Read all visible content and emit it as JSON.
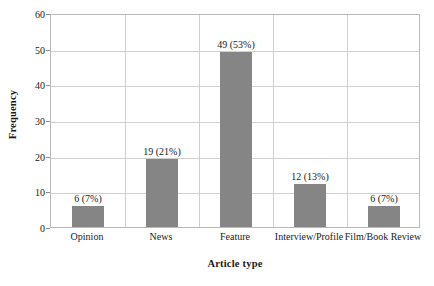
{
  "chart_data": {
    "type": "bar",
    "title": "",
    "xlabel": "Article type",
    "ylabel": "Frequency",
    "categories": [
      "Opinion",
      "News",
      "Feature",
      "Interview/Profile",
      "Film/Book Review"
    ],
    "values": [
      6,
      19,
      49,
      12,
      6
    ],
    "percentages": [
      "7%",
      "21%",
      "53%",
      "13%",
      "7%"
    ],
    "data_labels": [
      "6 (7%)",
      "19 (21%)",
      "49 (53%)",
      "12 (13%)",
      "6 (7%)"
    ],
    "ylim": [
      0,
      60
    ],
    "yticks": [
      0,
      10,
      20,
      30,
      40,
      50,
      60
    ],
    "ytick_labels": [
      "0",
      "10",
      "20",
      "30",
      "40",
      "50",
      "60"
    ],
    "grid": "horizontal-and-vertical",
    "legend": "none",
    "bar_color": "#858585",
    "gridline_color": "#cfcfcf",
    "axis_color": "#b9b9b9",
    "text_color": "#1a1a1a"
  },
  "axis_titles": {
    "x": "Article type",
    "y": "Frequency"
  },
  "y_ticks": [
    {
      "label": "60"
    },
    {
      "label": "50"
    },
    {
      "label": "40"
    },
    {
      "label": "30"
    },
    {
      "label": "20"
    },
    {
      "label": "10"
    },
    {
      "label": "0"
    }
  ],
  "bars": [
    {
      "category": "Opinion",
      "label": "6 (7%)",
      "value": 6
    },
    {
      "category": "News",
      "label": "19 (21%)",
      "value": 19
    },
    {
      "category": "Feature",
      "label": "49 (53%)",
      "value": 49
    },
    {
      "category": "Interview/Profile",
      "label": "12 (13%)",
      "value": 12
    },
    {
      "category": "Film/Book Review",
      "label": "6 (7%)",
      "value": 6
    }
  ]
}
